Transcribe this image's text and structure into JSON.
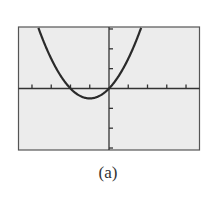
{
  "chart_data": {
    "type": "line",
    "title": "",
    "xlabel": "",
    "ylabel": "",
    "series": [
      {
        "name": "y = x^2 + 2x",
        "function": "x^2 + 2x",
        "vertex": [
          -1,
          -1
        ],
        "roots": [
          -2,
          0
        ]
      }
    ],
    "xlim": [
      -4.7,
      4.7
    ],
    "ylim": [
      -6.2,
      6.2
    ],
    "x_tick_step": 1,
    "y_tick_step": 2,
    "grid": false,
    "legend": "none",
    "background": "#ececec",
    "curve_color": "#2a2a2a",
    "axis_color": "#333333"
  },
  "caption": "(a)"
}
